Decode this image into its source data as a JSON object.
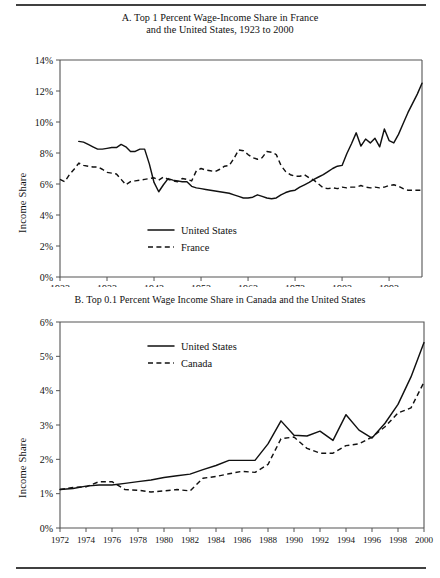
{
  "figure": {
    "top_rule": true,
    "bottom_rule": true
  },
  "panel_a": {
    "title_line1": "A. Top 1 Percent Wage-Income Share in France",
    "title_line2": "and the United States, 1923 to 2000",
    "ylabel": "Income Share",
    "yticks": [
      "0%",
      "2%",
      "4%",
      "6%",
      "8%",
      "10%",
      "12%",
      "14%"
    ],
    "xticks": [
      "1923",
      "1933",
      "1943",
      "1953",
      "1963",
      "1973",
      "1983",
      "1993"
    ],
    "legend": [
      {
        "label": "United States",
        "style": "solid"
      },
      {
        "label": "France",
        "style": "dashed"
      }
    ]
  },
  "panel_b": {
    "title": "B. Top 0.1 Percent Wage Income Share in Canada and the United States",
    "ylabel": "Income Share",
    "yticks": [
      "0%",
      "1%",
      "2%",
      "3%",
      "4%",
      "5%",
      "6%"
    ],
    "xticks": [
      "1972",
      "1974",
      "1976",
      "1978",
      "1980",
      "1982",
      "1984",
      "1986",
      "1988",
      "1990",
      "1992",
      "1994",
      "1996",
      "1998",
      "2000"
    ],
    "legend": [
      {
        "label": "United States",
        "style": "solid"
      },
      {
        "label": "Canada",
        "style": "dashed"
      }
    ]
  },
  "chart_data": [
    {
      "type": "line",
      "panel": "A",
      "title": "A. Top 1 Percent Wage-Income Share in France and the United States, 1923 to 2000",
      "xlabel": "",
      "ylabel": "Income Share",
      "xlim": [
        1923,
        2000
      ],
      "ylim": [
        0,
        14
      ],
      "yunit": "percent",
      "ytick_values": [
        0,
        2,
        4,
        6,
        8,
        10,
        12,
        14
      ],
      "xtick_values": [
        1923,
        1933,
        1943,
        1953,
        1963,
        1973,
        1983,
        1993
      ],
      "grid": false,
      "legend_position": "lower-center-left",
      "series": [
        {
          "name": "United States",
          "style": "solid",
          "x": [
            1927,
            1928,
            1929,
            1930,
            1931,
            1932,
            1933,
            1934,
            1935,
            1936,
            1937,
            1938,
            1939,
            1940,
            1941,
            1942,
            1943,
            1944,
            1945,
            1946,
            1947,
            1948,
            1949,
            1950,
            1951,
            1952,
            1953,
            1954,
            1955,
            1956,
            1957,
            1958,
            1959,
            1960,
            1961,
            1962,
            1963,
            1964,
            1965,
            1966,
            1967,
            1968,
            1969,
            1970,
            1971,
            1972,
            1973,
            1974,
            1975,
            1976,
            1977,
            1978,
            1979,
            1980,
            1981,
            1982,
            1983,
            1984,
            1985,
            1986,
            1987,
            1988,
            1989,
            1990,
            1991,
            1992,
            1993,
            1994,
            1995,
            1996,
            1997,
            1998,
            1999,
            2000
          ],
          "y": [
            8.75,
            8.7,
            8.55,
            8.4,
            8.25,
            8.25,
            8.3,
            8.35,
            8.35,
            8.55,
            8.4,
            8.1,
            8.1,
            8.25,
            8.25,
            7.3,
            6.1,
            5.5,
            5.95,
            6.35,
            6.25,
            6.2,
            6.15,
            6.15,
            5.85,
            5.75,
            5.7,
            5.65,
            5.6,
            5.55,
            5.5,
            5.45,
            5.4,
            5.3,
            5.2,
            5.1,
            5.1,
            5.15,
            5.3,
            5.2,
            5.1,
            5.05,
            5.1,
            5.3,
            5.45,
            5.55,
            5.6,
            5.8,
            5.95,
            6.1,
            6.3,
            6.45,
            6.6,
            6.8,
            7.0,
            7.15,
            7.2,
            7.95,
            8.6,
            9.3,
            8.45,
            8.9,
            8.65,
            8.95,
            8.4,
            9.55,
            8.8,
            8.65,
            9.2,
            9.9,
            10.6,
            11.2,
            11.8,
            12.5
          ]
        },
        {
          "name": "France",
          "style": "dashed",
          "x": [
            1923,
            1924,
            1925,
            1926,
            1927,
            1928,
            1929,
            1930,
            1931,
            1932,
            1933,
            1934,
            1935,
            1936,
            1937,
            1938,
            1939,
            1940,
            1941,
            1942,
            1943,
            1944,
            1945,
            1946,
            1947,
            1948,
            1949,
            1950,
            1951,
            1952,
            1953,
            1954,
            1955,
            1956,
            1957,
            1958,
            1959,
            1960,
            1961,
            1962,
            1963,
            1964,
            1965,
            1966,
            1967,
            1968,
            1969,
            1970,
            1971,
            1972,
            1973,
            1974,
            1975,
            1976,
            1977,
            1978,
            1979,
            1980,
            1981,
            1982,
            1983,
            1984,
            1985,
            1986,
            1987,
            1988,
            1989,
            1990,
            1991,
            1992,
            1993,
            1994,
            1995,
            1996,
            1997,
            1998,
            1999,
            2000
          ],
          "y": [
            6.3,
            6.15,
            6.6,
            6.95,
            7.35,
            7.2,
            7.15,
            7.1,
            7.1,
            6.95,
            6.75,
            6.7,
            6.65,
            6.3,
            5.95,
            6.15,
            6.2,
            6.25,
            6.3,
            6.35,
            6.4,
            6.25,
            6.45,
            6.3,
            6.2,
            6.15,
            6.35,
            6.3,
            6.2,
            6.85,
            7.0,
            6.9,
            6.85,
            6.8,
            6.95,
            7.15,
            7.2,
            7.65,
            8.2,
            8.15,
            7.9,
            7.7,
            7.6,
            7.7,
            8.1,
            8.05,
            7.9,
            7.2,
            6.8,
            6.6,
            6.5,
            6.5,
            6.6,
            6.4,
            6.25,
            6.0,
            5.75,
            5.7,
            5.75,
            5.7,
            5.8,
            5.75,
            5.8,
            5.8,
            5.9,
            5.8,
            5.75,
            5.8,
            5.75,
            5.8,
            5.9,
            5.95,
            5.85,
            5.7,
            5.6,
            5.6,
            5.6,
            5.6
          ]
        }
      ]
    },
    {
      "type": "line",
      "panel": "B",
      "title": "B. Top 0.1 Percent Wage Income Share in Canada and the United States",
      "xlabel": "",
      "ylabel": "Income Share",
      "xlim": [
        1972,
        2000
      ],
      "ylim": [
        0,
        6
      ],
      "yunit": "percent",
      "ytick_values": [
        0,
        1,
        2,
        3,
        4,
        5,
        6
      ],
      "xtick_values": [
        1972,
        1974,
        1976,
        1978,
        1980,
        1982,
        1984,
        1986,
        1988,
        1990,
        1992,
        1994,
        1996,
        1998,
        2000
      ],
      "grid": false,
      "legend_position": "upper-center-left",
      "series": [
        {
          "name": "United States",
          "style": "solid",
          "x": [
            1972,
            1973,
            1974,
            1975,
            1976,
            1977,
            1978,
            1979,
            1980,
            1981,
            1982,
            1983,
            1984,
            1985,
            1986,
            1987,
            1988,
            1989,
            1990,
            1991,
            1992,
            1993,
            1994,
            1995,
            1996,
            1997,
            1998,
            1999,
            2000
          ],
          "y": [
            1.12,
            1.15,
            1.22,
            1.25,
            1.25,
            1.3,
            1.35,
            1.4,
            1.47,
            1.52,
            1.57,
            1.7,
            1.82,
            1.97,
            1.97,
            1.97,
            2.45,
            3.12,
            2.7,
            2.68,
            2.82,
            2.55,
            3.3,
            2.85,
            2.62,
            3.05,
            3.6,
            4.4,
            5.4
          ]
        },
        {
          "name": "Canada",
          "style": "dashed",
          "x": [
            1972,
            1973,
            1974,
            1975,
            1976,
            1977,
            1978,
            1979,
            1980,
            1981,
            1982,
            1983,
            1984,
            1985,
            1986,
            1987,
            1988,
            1989,
            1990,
            1991,
            1992,
            1993,
            1994,
            1995,
            1996,
            1997,
            1998,
            1999,
            2000
          ],
          "y": [
            1.12,
            1.18,
            1.2,
            1.35,
            1.35,
            1.12,
            1.1,
            1.05,
            1.08,
            1.12,
            1.08,
            1.45,
            1.5,
            1.58,
            1.65,
            1.62,
            1.85,
            2.6,
            2.65,
            2.32,
            2.18,
            2.18,
            2.4,
            2.45,
            2.65,
            2.95,
            3.35,
            3.5,
            4.25
          ]
        }
      ]
    }
  ]
}
